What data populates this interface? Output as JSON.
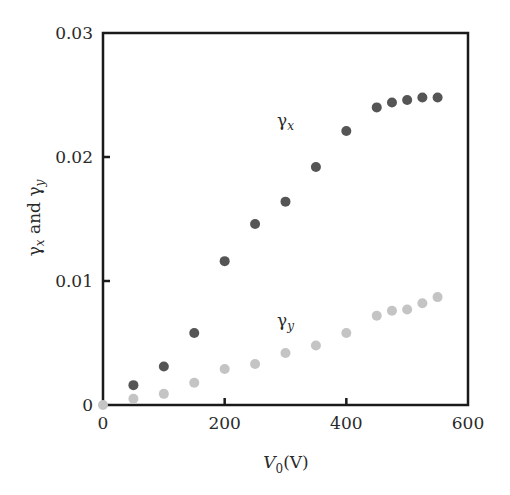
{
  "chart_data": {
    "type": "scatter",
    "title": "",
    "xlabel": "V0(V)",
    "xlabel_main": "V",
    "xlabel_sub": "0",
    "xlabel_unit": "(V)",
    "ylabel": "γx and γy",
    "xlim": [
      0,
      600
    ],
    "ylim": [
      0,
      0.03
    ],
    "xticks": [
      0,
      200,
      400,
      600
    ],
    "xtick_labels": [
      "0",
      "200",
      "400",
      "600"
    ],
    "yticks": [
      0,
      0.01,
      0.02,
      0.03
    ],
    "ytick_labels": [
      "0",
      "0.01",
      "0.02",
      "0.03"
    ],
    "grid": false,
    "legend": "inline labels",
    "series": [
      {
        "name": "γx",
        "label_main": "γ",
        "label_sub": "x",
        "color": "#555555",
        "label_pos": {
          "x": 300,
          "y": 0.0225
        },
        "points": [
          {
            "x": 50,
            "y": 0.0016
          },
          {
            "x": 100,
            "y": 0.0031
          },
          {
            "x": 150,
            "y": 0.0058
          },
          {
            "x": 200,
            "y": 0.0116
          },
          {
            "x": 250,
            "y": 0.0146
          },
          {
            "x": 300,
            "y": 0.0164
          },
          {
            "x": 350,
            "y": 0.0192
          },
          {
            "x": 400,
            "y": 0.0221
          },
          {
            "x": 450,
            "y": 0.024
          },
          {
            "x": 475,
            "y": 0.0244
          },
          {
            "x": 500,
            "y": 0.0246
          },
          {
            "x": 525,
            "y": 0.0248
          },
          {
            "x": 550,
            "y": 0.0248
          }
        ]
      },
      {
        "name": "γy",
        "label_main": "γ",
        "label_sub": "y",
        "color": "#c4c4c4",
        "label_pos": {
          "x": 300,
          "y": 0.0064
        },
        "points": [
          {
            "x": 0,
            "y": 0.0
          },
          {
            "x": 50,
            "y": 0.0005
          },
          {
            "x": 100,
            "y": 0.0009
          },
          {
            "x": 150,
            "y": 0.0018
          },
          {
            "x": 200,
            "y": 0.0029
          },
          {
            "x": 250,
            "y": 0.0033
          },
          {
            "x": 300,
            "y": 0.0042
          },
          {
            "x": 350,
            "y": 0.0048
          },
          {
            "x": 400,
            "y": 0.0058
          },
          {
            "x": 450,
            "y": 0.0072
          },
          {
            "x": 475,
            "y": 0.0076
          },
          {
            "x": 500,
            "y": 0.0077
          },
          {
            "x": 525,
            "y": 0.0082
          },
          {
            "x": 550,
            "y": 0.0087
          }
        ]
      }
    ]
  }
}
